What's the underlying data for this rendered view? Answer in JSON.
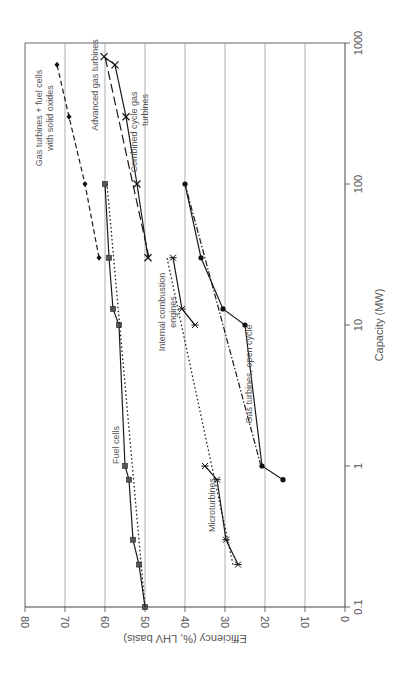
{
  "chart_data": {
    "type": "line",
    "orientation": "rotated-90-clockwise",
    "title": "",
    "xlabel": "Capacity (MW)",
    "ylabel": "Efficiency (%, LHV basis)",
    "xscale": "log",
    "xlim": [
      0.1,
      1000
    ],
    "ylim": [
      0,
      80
    ],
    "x_ticks": [
      "0.1",
      "1",
      "10",
      "100",
      "1000"
    ],
    "y_ticks": [
      "0",
      "10",
      "20",
      "30",
      "40",
      "50",
      "60",
      "70",
      "80"
    ],
    "grid": "major gridlines on efficiency axis",
    "legend": "none (inline annotations)",
    "series": [
      {
        "name": "Gas turbines + fuel cells with solid oxides",
        "style": "dashed",
        "marker": "diamond",
        "x": [
          30,
          100,
          300,
          700
        ],
        "y": [
          61.5,
          65,
          69,
          72
        ]
      },
      {
        "name": "Advanced gas turbines",
        "style": "long-dash",
        "marker": "none",
        "x": [
          30,
          800
        ],
        "y": [
          49,
          60
        ]
      },
      {
        "name": "Combined cycle gas turbines",
        "style": "solid",
        "marker": "x",
        "x": [
          30,
          100,
          300,
          700,
          800
        ],
        "y": [
          49.25,
          52,
          54.75,
          57.5,
          60.25
        ]
      },
      {
        "name": "Fuel cells",
        "style": "solid",
        "marker": "square",
        "x": [
          0.1,
          0.2,
          0.3,
          0.8,
          1,
          10,
          13,
          30,
          100
        ],
        "y": [
          50,
          51.5,
          53,
          54,
          55,
          56.5,
          58,
          59,
          60
        ]
      },
      {
        "name": "Fuel cells trend",
        "style": "dotted",
        "marker": "none",
        "x": [
          0.1,
          100
        ],
        "y": [
          50,
          59.5
        ]
      },
      {
        "name": "Internal combustion engines",
        "style": "solid",
        "marker": "asterisk",
        "x": [
          10,
          13,
          30
        ],
        "y": [
          37.5,
          40.75,
          43
        ]
      },
      {
        "name": "Internal combustion engines trend",
        "style": "dotted",
        "marker": "none",
        "x": [
          0.2,
          30
        ],
        "y": [
          28,
          44.5
        ]
      },
      {
        "name": "Microturbines",
        "style": "solid",
        "marker": "asterisk",
        "x": [
          0.2,
          0.3,
          0.8,
          1
        ],
        "y": [
          26.75,
          29.75,
          32,
          35
        ]
      },
      {
        "name": "Gas turbines, open cycle",
        "style": "solid",
        "marker": "dot",
        "x": [
          0.8,
          1,
          10,
          13,
          30,
          100
        ],
        "y": [
          15.5,
          20.75,
          25,
          30.5,
          36,
          40
        ]
      },
      {
        "name": "Gas turbines, open cycle trend",
        "style": "dash-dot",
        "marker": "none",
        "x": [
          1,
          100
        ],
        "y": [
          21,
          40
        ]
      }
    ],
    "annotations": [
      "Gas turbines + fuel cells",
      "with solid oxides",
      "Advanced gas turbines",
      "Combined cycle gas",
      "turbines",
      "Fuel cells",
      "Internal combustion",
      "engines",
      "Microturbines",
      "Gas turbines, open cycle"
    ]
  },
  "labels": {
    "xlabel": "Capacity (MW)",
    "ylabel": "Efficiency (%, LHV basis)",
    "x_ticks": [
      "0.1",
      "1",
      "10",
      "100",
      "1000"
    ],
    "y_ticks": [
      "80",
      "70",
      "60",
      "50",
      "40",
      "30",
      "20",
      "10",
      "0"
    ],
    "ann_gtfc_1": "Gas turbines + fuel cells",
    "ann_gtfc_2": "with solid oxides",
    "ann_agt": "Advanced gas turbines",
    "ann_ccgt_1": "Combined cycle gas",
    "ann_ccgt_2": "turbines",
    "ann_fc": "Fuel cells",
    "ann_ice_1": "Internal combustion",
    "ann_ice_2": "engines",
    "ann_micro": "Microturbines",
    "ann_gtoc": "Gas turbines, open cycle"
  }
}
